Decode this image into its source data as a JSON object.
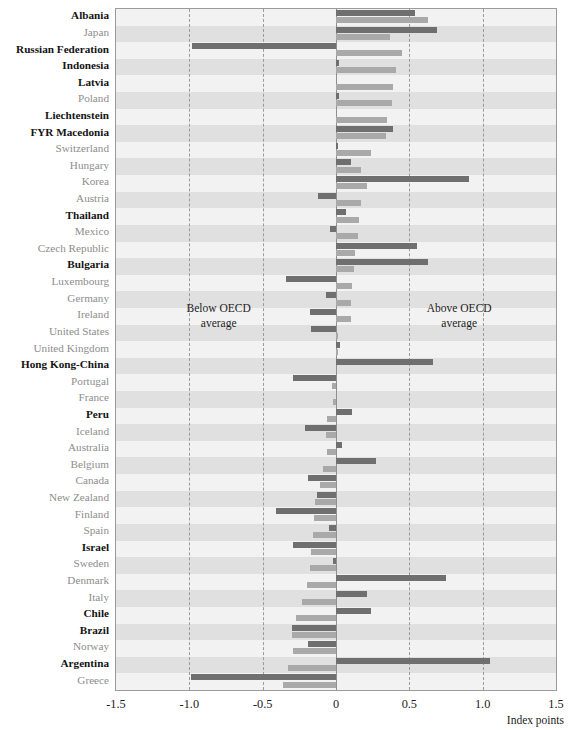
{
  "chart_data": {
    "type": "bar",
    "orientation": "horizontal",
    "title": "",
    "xlabel": "Index points",
    "ylabel": "",
    "xlim": [
      -1.5,
      1.5
    ],
    "xticks": [
      "-1.5",
      "-1.0",
      "-0.5",
      "0",
      "0.5",
      "1.0",
      "1.5"
    ],
    "xtick_values": [
      -1.5,
      -1.0,
      -0.5,
      0.0,
      0.5,
      1.0,
      1.5
    ],
    "grid": "vertical dashed gridlines at each tick",
    "legend": "none",
    "annotations": [
      {
        "text": "Below OECD\naverage",
        "x": -0.8,
        "position": "left-of-zero"
      },
      {
        "text": "Above OECD\naverage",
        "x": 0.85,
        "position": "right-of-zero"
      }
    ],
    "series": [
      {
        "name": "series-1",
        "style": "dark-gray"
      },
      {
        "name": "series-2",
        "style": "light-gray"
      }
    ],
    "categories": [
      "Albania",
      "Japan",
      "Russian Federation",
      "Indonesia",
      "Latvia",
      "Poland",
      "Liechtenstein",
      "FYR Macedonia",
      "Switzerland",
      "Hungary",
      "Korea",
      "Austria",
      "Thailand",
      "Mexico",
      "Czech Republic",
      "Bulgaria",
      "Luxembourg",
      "Germany",
      "Ireland",
      "United States",
      "United Kingdom",
      "Hong Kong-China",
      "Portugal",
      "France",
      "Peru",
      "Iceland",
      "Australia",
      "Belgium",
      "Canada",
      "New Zealand",
      "Finland",
      "Spain",
      "Israel",
      "Sweden",
      "Denmark",
      "Italy",
      "Chile",
      "Brazil",
      "Norway",
      "Argentina",
      "Greece"
    ],
    "category_emphasis": [
      "bold",
      "plain",
      "bold",
      "bold",
      "bold",
      "plain",
      "bold",
      "bold",
      "plain",
      "plain",
      "plain",
      "plain",
      "bold",
      "plain",
      "plain",
      "bold",
      "plain",
      "plain",
      "plain",
      "plain",
      "plain",
      "bold",
      "plain",
      "plain",
      "bold",
      "plain",
      "plain",
      "plain",
      "plain",
      "plain",
      "plain",
      "plain",
      "bold",
      "plain",
      "plain",
      "plain",
      "bold",
      "bold",
      "plain",
      "bold",
      "plain"
    ],
    "rows": [
      {
        "category": "Albania",
        "emphasis": "bold",
        "dark": 0.54,
        "light": 0.63
      },
      {
        "category": "Japan",
        "emphasis": "plain",
        "dark": 0.69,
        "light": 0.37
      },
      {
        "category": "Russian Federation",
        "emphasis": "bold",
        "dark": -0.98,
        "light": 0.45
      },
      {
        "category": "Indonesia",
        "emphasis": "bold",
        "dark": 0.02,
        "light": 0.41
      },
      {
        "category": "Latvia",
        "emphasis": "bold",
        "dark": 0.0,
        "light": 0.39
      },
      {
        "category": "Poland",
        "emphasis": "plain",
        "dark": 0.02,
        "light": 0.38
      },
      {
        "category": "Liechtenstein",
        "emphasis": "bold",
        "dark": 0.0,
        "light": 0.35
      },
      {
        "category": "FYR Macedonia",
        "emphasis": "bold",
        "dark": 0.39,
        "light": 0.34
      },
      {
        "category": "Switzerland",
        "emphasis": "plain",
        "dark": 0.01,
        "light": 0.24
      },
      {
        "category": "Hungary",
        "emphasis": "plain",
        "dark": 0.1,
        "light": 0.17
      },
      {
        "category": "Korea",
        "emphasis": "plain",
        "dark": 0.91,
        "light": 0.21
      },
      {
        "category": "Austria",
        "emphasis": "plain",
        "dark": -0.12,
        "light": 0.17
      },
      {
        "category": "Thailand",
        "emphasis": "bold",
        "dark": 0.07,
        "light": 0.16
      },
      {
        "category": "Mexico",
        "emphasis": "plain",
        "dark": -0.04,
        "light": 0.15
      },
      {
        "category": "Czech Republic",
        "emphasis": "plain",
        "dark": 0.55,
        "light": 0.13
      },
      {
        "category": "Bulgaria",
        "emphasis": "bold",
        "dark": 0.63,
        "light": 0.12
      },
      {
        "category": "Luxembourg",
        "emphasis": "plain",
        "dark": -0.34,
        "light": 0.11
      },
      {
        "category": "Germany",
        "emphasis": "plain",
        "dark": -0.07,
        "light": 0.1
      },
      {
        "category": "Ireland",
        "emphasis": "plain",
        "dark": -0.18,
        "light": 0.1
      },
      {
        "category": "United States",
        "emphasis": "plain",
        "dark": -0.17,
        "light": 0.01
      },
      {
        "category": "United Kingdom",
        "emphasis": "plain",
        "dark": 0.03,
        "light": 0.01
      },
      {
        "category": "Hong Kong-China",
        "emphasis": "bold",
        "dark": 0.66,
        "light": 0.0
      },
      {
        "category": "Portugal",
        "emphasis": "plain",
        "dark": -0.29,
        "light": -0.03
      },
      {
        "category": "France",
        "emphasis": "plain",
        "dark": 0.0,
        "light": -0.02
      },
      {
        "category": "Peru",
        "emphasis": "bold",
        "dark": 0.11,
        "light": -0.06
      },
      {
        "category": "Iceland",
        "emphasis": "plain",
        "dark": -0.21,
        "light": -0.07
      },
      {
        "category": "Australia",
        "emphasis": "plain",
        "dark": 0.04,
        "light": -0.06
      },
      {
        "category": "Belgium",
        "emphasis": "plain",
        "dark": 0.27,
        "light": -0.09
      },
      {
        "category": "Canada",
        "emphasis": "plain",
        "dark": -0.19,
        "light": -0.11
      },
      {
        "category": "New Zealand",
        "emphasis": "plain",
        "dark": -0.13,
        "light": -0.14
      },
      {
        "category": "Finland",
        "emphasis": "plain",
        "dark": -0.41,
        "light": -0.15
      },
      {
        "category": "Spain",
        "emphasis": "plain",
        "dark": -0.05,
        "light": -0.16
      },
      {
        "category": "Israel",
        "emphasis": "bold",
        "dark": -0.29,
        "light": -0.17
      },
      {
        "category": "Sweden",
        "emphasis": "plain",
        "dark": -0.02,
        "light": -0.18
      },
      {
        "category": "Denmark",
        "emphasis": "plain",
        "dark": 0.75,
        "light": -0.2
      },
      {
        "category": "Italy",
        "emphasis": "plain",
        "dark": 0.21,
        "light": -0.23
      },
      {
        "category": "Chile",
        "emphasis": "bold",
        "dark": 0.24,
        "light": -0.27
      },
      {
        "category": "Brazil",
        "emphasis": "bold",
        "dark": -0.3,
        "light": -0.3
      },
      {
        "category": "Norway",
        "emphasis": "plain",
        "dark": -0.19,
        "light": -0.29
      },
      {
        "category": "Argentina",
        "emphasis": "bold",
        "dark": 1.05,
        "light": -0.33
      },
      {
        "category": "Greece",
        "emphasis": "plain",
        "dark": -0.99,
        "light": -0.36
      }
    ]
  },
  "axis": {
    "ticks": [
      "-1.5",
      "-1.0",
      "-0.5",
      "0",
      "0.5",
      "1.0",
      "1.5"
    ],
    "title": "Index points"
  },
  "annotations": {
    "below": "Below OECD\naverage",
    "above": "Above OECD\naverage"
  },
  "colors": {
    "dark_bar": "#6f6f6f",
    "light_bar": "#a9a9a9",
    "band_shade": "#cdcdcd",
    "grid": "#9a9a9a",
    "label_bold": "#141414",
    "label_plain": "#8d8d8d"
  }
}
